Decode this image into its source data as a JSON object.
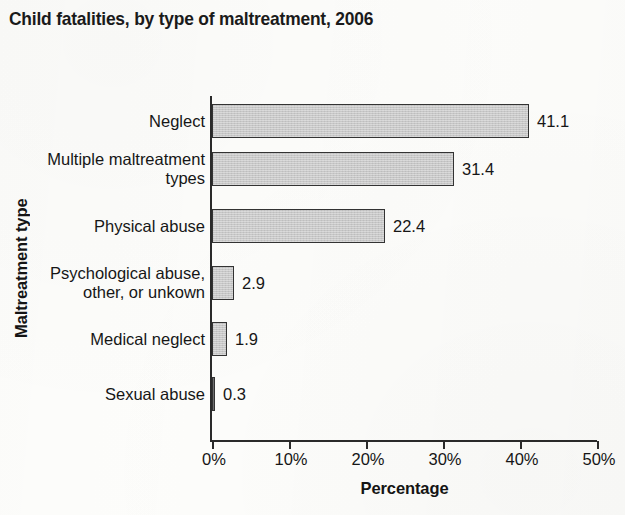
{
  "chart_data": {
    "type": "bar",
    "orientation": "horizontal",
    "title": "Child fatalities, by type of maltreatment, 2006",
    "xlabel": "Percentage",
    "ylabel": "Maltreatment type",
    "categories": [
      "Neglect",
      "Multiple maltreatment\ntypes",
      "Physical abuse",
      "Psychological abuse,\nother, or unkown",
      "Medical neglect",
      "Sexual abuse"
    ],
    "values": [
      41.1,
      31.4,
      22.4,
      2.9,
      1.9,
      0.3
    ],
    "value_labels": [
      "41.1",
      "31.4",
      "22.4",
      "2.9",
      "1.9",
      "0.3"
    ],
    "xlim": [
      0,
      50
    ],
    "xticks": [
      0,
      10,
      20,
      30,
      40,
      50
    ],
    "xtick_labels": [
      "0%",
      "10%",
      "20%",
      "30%",
      "40%",
      "50%"
    ],
    "grid": false,
    "legend": false,
    "bar_fill_color": "#c9c9c9",
    "bar_border_color": "#333333",
    "background_color": "#fdfdfb",
    "text_color": "#161616"
  }
}
